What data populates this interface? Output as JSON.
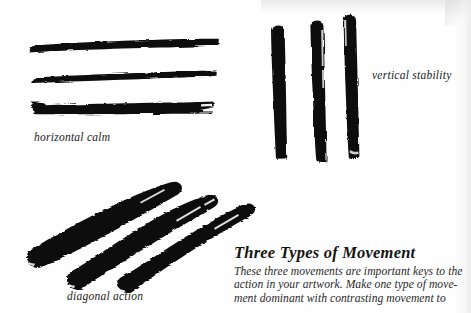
{
  "page": {
    "background_color": "#fefefe",
    "ink_color": "#111111",
    "width": 471,
    "height": 313
  },
  "captions": [
    {
      "id": "horizontal-calm",
      "label": "horizontal calm"
    },
    {
      "id": "vertical-stability",
      "label": "vertical stability"
    },
    {
      "id": "diagonal-action",
      "label": "diagonal action"
    }
  ],
  "text_block": {
    "title": "Three Types of Movement",
    "body_lines": [
      "These three movements are important keys to the",
      "action in your artwork. Make one type of move-",
      "ment dominant with contrasting movement to"
    ]
  },
  "artwork": {
    "description": "Three groups of black sumi-e style brush strokes demonstrating directional movement",
    "groups": [
      {
        "id": "horizontal-strokes",
        "name": "horizontal-calm-strokes",
        "orientation": "horizontal",
        "count": 3,
        "strokes": [
          {
            "x1": 30,
            "y1": 47,
            "x2": 218,
            "y2": 43,
            "thickness": 15
          },
          {
            "x1": 32,
            "y1": 79,
            "x2": 216,
            "y2": 76,
            "thickness": 11
          },
          {
            "x1": 31,
            "y1": 108,
            "x2": 214,
            "y2": 106,
            "thickness": 13
          }
        ]
      },
      {
        "id": "vertical-strokes",
        "name": "vertical-stability-strokes",
        "orientation": "vertical",
        "count": 3,
        "strokes": [
          {
            "x1": 277,
            "y1": 26,
            "x2": 282,
            "y2": 158,
            "thickness": 14
          },
          {
            "x1": 316,
            "y1": 21,
            "x2": 320,
            "y2": 162,
            "thickness": 13
          },
          {
            "x1": 348,
            "y1": 16,
            "x2": 353,
            "y2": 159,
            "thickness": 12
          }
        ]
      },
      {
        "id": "diagonal-strokes",
        "name": "diagonal-action-strokes",
        "orientation": "diagonal",
        "angle_degrees": -22,
        "count": 3,
        "strokes": [
          {
            "x1": 28,
            "y1": 262,
            "x2": 179,
            "y2": 188,
            "thickness": 16
          },
          {
            "x1": 69,
            "y1": 283,
            "x2": 216,
            "y2": 201,
            "thickness": 15
          },
          {
            "x1": 119,
            "y1": 288,
            "x2": 254,
            "y2": 209,
            "thickness": 13
          }
        ]
      }
    ]
  }
}
